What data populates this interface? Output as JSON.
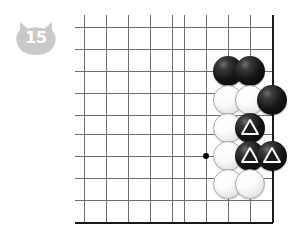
{
  "page": {
    "kind": "go-board-diagram",
    "width": 306,
    "height": 235,
    "background": "#ffffff"
  },
  "badge": {
    "label": "15",
    "shape": "cat-head",
    "fill": "#c9c9c9",
    "text_color": "#ffffff"
  },
  "board": {
    "line_color": "#6e6e6e",
    "edge_color": "#1a1a1a",
    "star_color": "#000000",
    "grid": {
      "x_lines": [
        84,
        106,
        128,
        150,
        172,
        184,
        206,
        228,
        250,
        272
      ],
      "y_lines": [
        27,
        49,
        71,
        93,
        115,
        134,
        156,
        178,
        200,
        222
      ],
      "cell": 22,
      "left": 84,
      "top": 27,
      "right": 272,
      "bottom": 222
    },
    "edges": [
      "right",
      "bottom"
    ],
    "star_points": [
      {
        "x": 206,
        "y": 156
      }
    ]
  },
  "stones": [
    {
      "color": "black",
      "x": 228,
      "y": 71,
      "mark": "none"
    },
    {
      "color": "black",
      "x": 250,
      "y": 71,
      "mark": "none"
    },
    {
      "color": "white",
      "x": 228,
      "y": 100,
      "mark": "none"
    },
    {
      "color": "white",
      "x": 250,
      "y": 100,
      "mark": "none"
    },
    {
      "color": "black",
      "x": 272,
      "y": 100,
      "mark": "none"
    },
    {
      "color": "white",
      "x": 228,
      "y": 128,
      "mark": "none"
    },
    {
      "color": "black",
      "x": 250,
      "y": 128,
      "mark": "triangle"
    },
    {
      "color": "white",
      "x": 228,
      "y": 156,
      "mark": "none"
    },
    {
      "color": "black",
      "x": 250,
      "y": 156,
      "mark": "triangle"
    },
    {
      "color": "black",
      "x": 272,
      "y": 156,
      "mark": "triangle"
    },
    {
      "color": "white",
      "x": 228,
      "y": 184,
      "mark": "none"
    },
    {
      "color": "white",
      "x": 250,
      "y": 184,
      "mark": "none"
    }
  ],
  "marks": {
    "triangle_stroke": "#ffffff",
    "triangle_fill": "#1c1c1c"
  }
}
